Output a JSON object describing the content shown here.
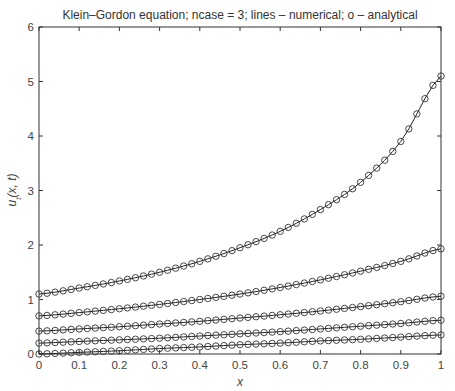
{
  "chart_data": {
    "type": "line",
    "title": "Klein–Gordon equation; ncase = 3; lines – numerical; o – analytical",
    "xlabel": "x",
    "ylabel": "u_t(x, t)",
    "xlim": [
      0,
      1
    ],
    "ylim": [
      0,
      6
    ],
    "grid": false,
    "legend": null,
    "xticks": [
      "0",
      "0.1",
      "0.2",
      "0.3",
      "0.4",
      "0.5",
      "0.6",
      "0.7",
      "0.8",
      "0.9",
      "1"
    ],
    "yticks": [
      "0",
      "1",
      "2",
      "3",
      "4",
      "5",
      "6"
    ],
    "marker": "o",
    "marker_spacing": 0.02,
    "x": [
      0,
      0.1,
      0.2,
      0.3,
      0.4,
      0.5,
      0.6,
      0.7,
      0.8,
      0.9,
      1.0
    ],
    "series": [
      {
        "name": "curve-1",
        "values": [
          1.1,
          1.21,
          1.34,
          1.5,
          1.7,
          1.95,
          2.25,
          2.65,
          3.15,
          3.9,
          5.1
        ]
      },
      {
        "name": "curve-2",
        "values": [
          0.7,
          0.76,
          0.83,
          0.91,
          1.0,
          1.1,
          1.22,
          1.36,
          1.52,
          1.7,
          1.93
        ]
      },
      {
        "name": "curve-3",
        "values": [
          0.42,
          0.46,
          0.5,
          0.55,
          0.6,
          0.66,
          0.72,
          0.79,
          0.87,
          0.96,
          1.06
        ]
      },
      {
        "name": "curve-4",
        "values": [
          0.2,
          0.23,
          0.26,
          0.29,
          0.33,
          0.37,
          0.41,
          0.46,
          0.51,
          0.56,
          0.62
        ]
      },
      {
        "name": "curve-5",
        "values": [
          0.0,
          0.03,
          0.06,
          0.1,
          0.13,
          0.17,
          0.2,
          0.24,
          0.27,
          0.31,
          0.35
        ]
      }
    ]
  }
}
